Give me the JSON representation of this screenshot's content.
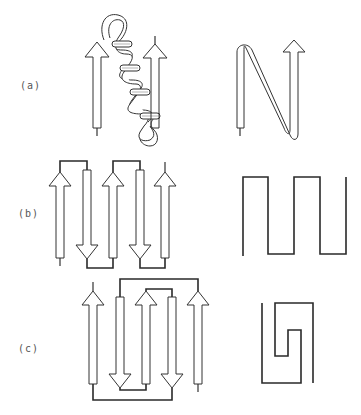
{
  "figure": {
    "panels": [
      {
        "id": "a",
        "label": "(a)",
        "description": "beta-alpha-beta motif: two parallel beta strands connected by an alpha helix",
        "strand_directions": [
          "up",
          "up"
        ],
        "connection": "helix",
        "topology_sketch": "N-shaped ribbon"
      },
      {
        "id": "b",
        "label": "(b)",
        "description": "beta meander: five antiparallel strands connected by hairpins",
        "strand_directions": [
          "up",
          "down",
          "up",
          "down",
          "up"
        ],
        "connection": "hairpins",
        "topology_sketch": "square-wave meander"
      },
      {
        "id": "c",
        "label": "(c)",
        "description": "Greek key motif: four/five antiparallel strands with crossing connection",
        "strand_directions": [
          "up",
          "down",
          "up",
          "down",
          "up"
        ],
        "connection": "greek-key",
        "topology_sketch": "greek key spiral"
      }
    ],
    "colors": {
      "line": "#2a2a2a",
      "fill": "#ffffff",
      "label": "#555555"
    }
  }
}
